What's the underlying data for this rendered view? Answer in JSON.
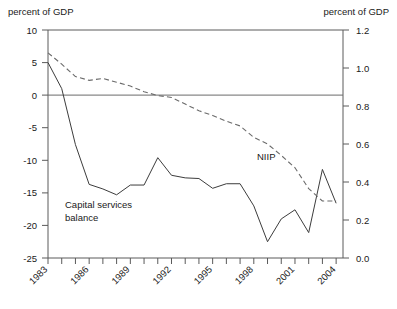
{
  "chart_data": {
    "type": "line",
    "title": "",
    "xlabel": "",
    "ylabel_left": "percent of GDP",
    "ylabel_right": "percent of GDP",
    "grid": false,
    "legend_position": "inline-annotations",
    "x": [
      1983,
      1984,
      1985,
      1986,
      1987,
      1988,
      1989,
      1990,
      1991,
      1992,
      1993,
      1994,
      1995,
      1996,
      1997,
      1998,
      1999,
      2000,
      2001,
      2002,
      2003,
      2004
    ],
    "xlim": [
      1983,
      2004.5
    ],
    "xtick_labels": [
      "1983",
      "1986",
      "1989",
      "1992",
      "1995",
      "1998",
      "2001",
      "2004"
    ],
    "xtick_values": [
      1983,
      1986,
      1989,
      1992,
      1995,
      1998,
      2001,
      2004
    ],
    "ylim_left": [
      -25,
      10
    ],
    "ytick_labels_left": [
      "10",
      "5",
      "0",
      "-5",
      "-10",
      "-15",
      "-20",
      "-25"
    ],
    "ytick_values_left": [
      10,
      5,
      0,
      -5,
      -10,
      -15,
      -20,
      -25
    ],
    "ylim_right": [
      0.0,
      1.2
    ],
    "ytick_labels_right": [
      "1.2",
      "1.0",
      "0.8",
      "0.6",
      "0.4",
      "0.2",
      "0.0"
    ],
    "ytick_values_right": [
      1.2,
      1.0,
      0.8,
      0.6,
      0.4,
      0.2,
      0.0
    ],
    "zero_reference_left": 0,
    "series": [
      {
        "name": "Capital services balance",
        "axis": "left",
        "style": "solid",
        "color": "#3c3c3c",
        "label_x": 1984.2,
        "label_y": -17.4,
        "values": [
          5.0,
          1.0,
          -7.6,
          -13.7,
          -14.4,
          -15.3,
          -13.8,
          -13.8,
          -9.6,
          -12.3,
          -12.7,
          -12.8,
          -14.3,
          -13.6,
          -13.6,
          -17.0,
          -22.5,
          -19.0,
          -17.6,
          -21.1,
          -11.4,
          -16.6
        ]
      },
      {
        "name": "NIIP",
        "axis": "right",
        "style": "dashed",
        "color": "#6b6b6b",
        "label_x": 1997.0,
        "label_y_right": 0.545,
        "values": [
          1.08,
          1.02,
          0.955,
          0.935,
          0.945,
          0.925,
          0.905,
          0.875,
          0.855,
          0.845,
          0.81,
          0.775,
          0.75,
          0.72,
          0.695,
          0.635,
          0.6,
          0.54,
          0.475,
          0.365,
          0.3,
          0.3
        ]
      }
    ],
    "annotations": [
      {
        "text": "Capital services balance",
        "line1": "Capital services",
        "line2": "balance"
      },
      {
        "text": "NIIP"
      }
    ]
  },
  "axis": {
    "left_title": "percent of GDP",
    "right_title": "percent of GDP"
  },
  "labels": {
    "capital_line1": "Capital services",
    "capital_line2": "balance",
    "niip": "NIIP"
  }
}
